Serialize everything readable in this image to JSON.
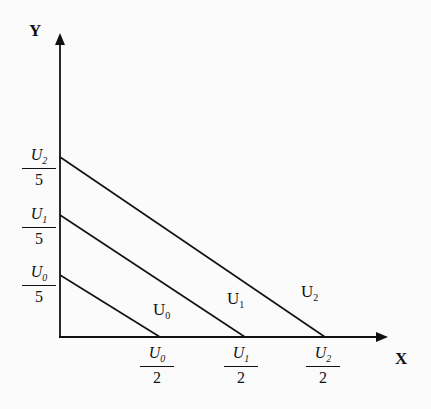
{
  "diagram": {
    "axes": {
      "x_label": "X",
      "y_label": "Y"
    },
    "y_intercepts": [
      {
        "var": "U",
        "sub": "2",
        "den": "5"
      },
      {
        "var": "U",
        "sub": "1",
        "den": "5"
      },
      {
        "var": "U",
        "sub": "0",
        "den": "5"
      }
    ],
    "x_intercepts": [
      {
        "var": "U",
        "sub": "0",
        "den": "2"
      },
      {
        "var": "U",
        "sub": "1",
        "den": "2"
      },
      {
        "var": "U",
        "sub": "2",
        "den": "2"
      }
    ],
    "curves": [
      {
        "var": "U",
        "sub": "0"
      },
      {
        "var": "U",
        "sub": "1"
      },
      {
        "var": "U",
        "sub": "2"
      }
    ],
    "line_color": "#111111"
  }
}
